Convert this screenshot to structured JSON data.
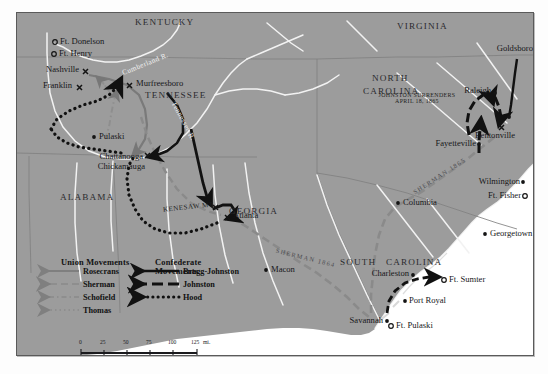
{
  "map": {
    "title": "Civil War Campaigns in the Western and Carolinas Theaters",
    "colors": {
      "land": "#9c9c9c",
      "water": "#ffffff",
      "river": "#f5f5f5",
      "union_rosecrans": "#6f6f6f",
      "union_sherman": "#8e8e8e",
      "union_schofield": "#8e8e8e",
      "union_thomas": "#8e8e8e",
      "confederate": "#111111",
      "border": "#5a5a5a",
      "state_line": "#7b7b7b"
    },
    "states": [
      {
        "name": "KENTUCKY",
        "x": 118,
        "y": 9
      },
      {
        "name": "VIRGINIA",
        "x": 380,
        "y": 13
      },
      {
        "name": "TENNESSEE",
        "x": 128,
        "y": 82
      },
      {
        "name": "NORTH",
        "x": 355,
        "y": 65
      },
      {
        "name": "CAROLINA",
        "x": 348,
        "y": 78
      },
      {
        "name": "ALABAMA",
        "x": 43,
        "y": 184
      },
      {
        "name": "GEORGIA",
        "x": 212,
        "y": 198
      },
      {
        "name": "SOUTH",
        "x": 327,
        "y": 249
      },
      {
        "name": "CAROLINA",
        "x": 369,
        "y": 249
      }
    ],
    "cities": [
      {
        "name": "Nashville",
        "x": 62,
        "y": 58,
        "anchor": "right",
        "marker": "battle"
      },
      {
        "name": "Franklin",
        "x": 55,
        "y": 74,
        "anchor": "right",
        "marker": "battle"
      },
      {
        "name": "Murfreesboro",
        "x": 119,
        "y": 71,
        "anchor": "left",
        "marker": "battle"
      },
      {
        "name": "Pulaski",
        "x": 77,
        "y": 124,
        "anchor": "left",
        "marker": "dot"
      },
      {
        "name": "Chattanooga",
        "x": 94,
        "y": 145,
        "anchor": "right",
        "marker": "battle"
      },
      {
        "name": "Chickamauga",
        "x": 95,
        "y": 155,
        "anchor": "right",
        "marker": "battle"
      },
      {
        "name": "Atlanta",
        "x": 213,
        "y": 200,
        "anchor": "left",
        "marker": "battle"
      },
      {
        "name": "Macon",
        "x": 251,
        "y": 256,
        "anchor": "left",
        "marker": "dot"
      },
      {
        "name": "Columbia",
        "x": 385,
        "y": 190,
        "anchor": "left",
        "marker": "dot"
      },
      {
        "name": "Charleston",
        "x": 392,
        "y": 258,
        "anchor": "right",
        "marker": "dot"
      },
      {
        "name": "Savannah",
        "x": 368,
        "y": 306,
        "anchor": "right",
        "marker": "dot"
      },
      {
        "name": "Port Royal",
        "x": 392,
        "y": 288,
        "anchor": "left",
        "marker": "dot"
      },
      {
        "name": "Georgetown",
        "x": 472,
        "y": 221,
        "anchor": "left",
        "marker": "dot"
      },
      {
        "name": "Wilmington",
        "x": 503,
        "y": 169,
        "anchor": "right",
        "marker": "dot"
      },
      {
        "name": "Fayetteville",
        "x": 460,
        "y": 129,
        "anchor": "right",
        "marker": "dot"
      },
      {
        "name": "Raleigh",
        "x": 474,
        "y": 79,
        "anchor": "right",
        "marker": "dot"
      },
      {
        "name": "Goldsboro",
        "x": 497,
        "y": 37,
        "anchor": "right",
        "marker": "dot"
      },
      {
        "name": "Bentonville",
        "x": 498,
        "y": 117,
        "anchor": "right",
        "marker": "battle"
      }
    ],
    "forts": [
      {
        "name": "Ft. Donelson",
        "x": 41,
        "y": 29
      },
      {
        "name": "Ft. Henry",
        "x": 40,
        "y": 41
      },
      {
        "name": "Ft. Fisher",
        "x": 505,
        "y": 183
      },
      {
        "name": "Ft. Sumter",
        "x": 432,
        "y": 267
      },
      {
        "name": "Ft. Pulaski",
        "x": 378,
        "y": 313
      }
    ],
    "battle_labels": [
      {
        "name": "KENESAW MT.",
        "x": 166,
        "y": 196
      }
    ],
    "rivers": [
      {
        "name": "Cumberland R.",
        "x": 104,
        "y": 52,
        "rotate": -22
      },
      {
        "name": "Tennessee R.",
        "x": 159,
        "y": 88,
        "rotate": 62
      }
    ],
    "march_labels": [
      {
        "name": "SHERMAN 1864",
        "x": 272,
        "y": 246,
        "rotate": 14
      },
      {
        "name": "SHERMAN 1865",
        "x": 405,
        "y": 158,
        "rotate": -33
      }
    ],
    "annotations": [
      {
        "line1": "JOHNSTON SURRENDERS",
        "line2": "APRIL 18, 1865",
        "x": 400,
        "y": 84
      }
    ]
  },
  "legend": {
    "union_title": "Union Movements",
    "confederate_title": "Confederate Movements",
    "union_items": [
      {
        "label": "Rosecrans",
        "style": "solid-gray"
      },
      {
        "label": "Sherman",
        "style": "dashed-gray"
      },
      {
        "label": "Schofield",
        "style": "dashdot-gray"
      },
      {
        "label": "Thomas",
        "style": "dotted-gray"
      }
    ],
    "confederate_items": [
      {
        "label": "Bragg-Johnston",
        "style": "solid-black"
      },
      {
        "label": "Johnston",
        "style": "dashed-black"
      },
      {
        "label": "Hood",
        "style": "dotted-black"
      }
    ]
  },
  "scale": {
    "ticks": [
      "0",
      "25",
      "50",
      "75",
      "100",
      "125"
    ],
    "unit": "mi."
  }
}
